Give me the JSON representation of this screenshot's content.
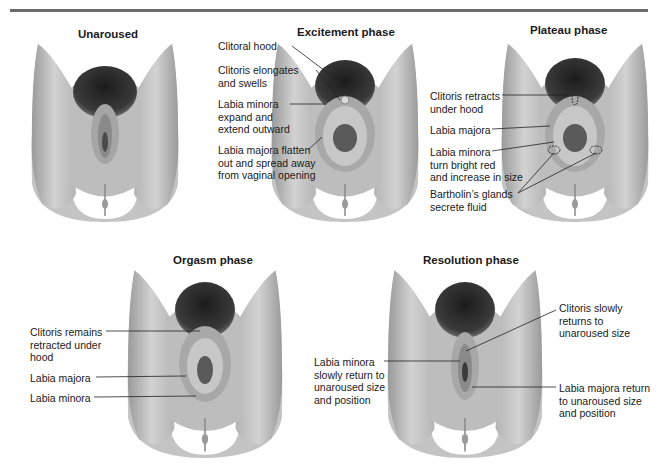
{
  "figure": {
    "type": "anatomical-diagram",
    "colors": {
      "skin": "#c9c9c9",
      "skin_shadow": "#8f8f8f",
      "hair": "#2b2b2b",
      "rule": "#6b6b6b",
      "text": "#1a1a1a"
    }
  },
  "panels": [
    {
      "id": "unaroused",
      "title": "Unaroused",
      "labels": []
    },
    {
      "id": "excitement",
      "title": "Excitement phase",
      "labels": [
        {
          "text": "Clitoral hood"
        },
        {
          "text": "Clitoris elongates\nand swells"
        },
        {
          "text": "Labia minora\nexpand and\nextend outward"
        },
        {
          "text": "Labia majora flatten\nout and spread away\nfrom vaginal opening"
        }
      ]
    },
    {
      "id": "plateau",
      "title": "Plateau phase",
      "labels": [
        {
          "text": "Clitoris retracts\nunder hood"
        },
        {
          "text": "Labia majora"
        },
        {
          "text": "Labia minora\nturn bright red\nand increase in size"
        },
        {
          "text": "Bartholin’s glands\nsecrete fluid"
        }
      ]
    },
    {
      "id": "orgasm",
      "title": "Orgasm phase",
      "labels": [
        {
          "text": "Clitoris remains\nretracted under\nhood"
        },
        {
          "text": "Labia majora"
        },
        {
          "text": "Labia minora"
        }
      ]
    },
    {
      "id": "resolution",
      "title": "Resolution phase",
      "labels": [
        {
          "text": "Clitoris slowly\nreturns to\nunaroused size"
        },
        {
          "text": "Labia minora\nslowly return to\nunaroused size\nand position"
        },
        {
          "text": "Labia majora return\nto unaroused size\nand position"
        }
      ]
    }
  ]
}
